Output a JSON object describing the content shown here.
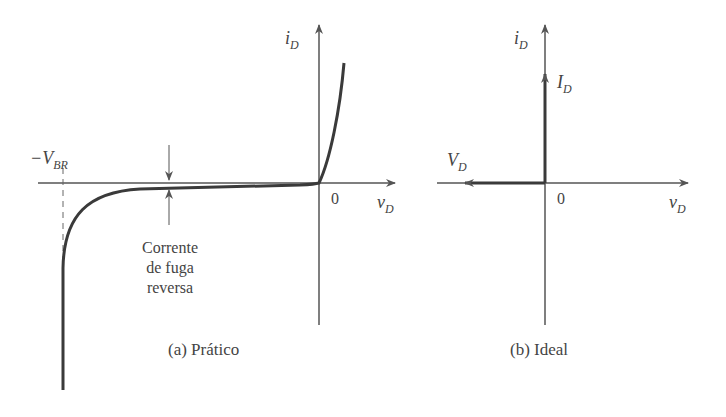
{
  "panels": [
    {
      "id": "a",
      "caption": "(a) Prático",
      "y_axis": {
        "var": "i",
        "sub": "D"
      },
      "x_axis": {
        "var": "v",
        "sub": "D"
      },
      "origin_label": "0",
      "breakdown_label": {
        "prefix": "−V",
        "sub": "BR"
      },
      "annotation": [
        "Corrente",
        "de fuga",
        "reversa"
      ]
    },
    {
      "id": "b",
      "caption": "(b) Ideal",
      "y_axis": {
        "var": "i",
        "sub": "D"
      },
      "x_axis": {
        "var": "v",
        "sub": "D"
      },
      "origin_label": "0",
      "forward_label": {
        "var": "I",
        "sub": "D"
      },
      "reverse_label": {
        "var": "V",
        "sub": "D"
      }
    }
  ],
  "colors": {
    "ink": "#444444",
    "curve": "#3a3a3a",
    "background": "#ffffff"
  }
}
